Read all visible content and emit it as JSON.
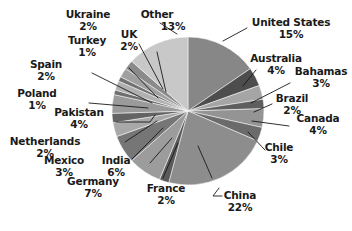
{
  "chart_data": {
    "type": "pie",
    "title": "",
    "legend_position": "outside-labels",
    "total_percent": 100,
    "start_angle_deg": 0,
    "direction": "clockwise",
    "categories": [
      "United States",
      "Australia",
      "Bahamas",
      "Brazil",
      "Canada",
      "Chile",
      "China",
      "France",
      "Germany",
      "India",
      "Mexico",
      "Netherlands",
      "Pakistan",
      "Poland",
      "Spain",
      "Turkey",
      "UK",
      "Ukraine",
      "Other"
    ],
    "values": [
      15,
      4,
      3,
      2,
      4,
      3,
      22,
      2,
      7,
      6,
      3,
      2,
      4,
      1,
      2,
      1,
      2,
      2,
      13
    ],
    "value_unit": "%",
    "slices": [
      {
        "name": "United States",
        "percent": 15,
        "label": "United States",
        "percent_label": "15%",
        "color": "#878787"
      },
      {
        "name": "Australia",
        "percent": 4,
        "label": "Australia",
        "percent_label": "4%",
        "color": "#4d4d4d"
      },
      {
        "name": "Bahamas",
        "percent": 3,
        "label": "Bahamas",
        "percent_label": "3%",
        "color": "#a5a5a5"
      },
      {
        "name": "Brazil",
        "percent": 2,
        "label": "Brazil",
        "percent_label": "2%",
        "color": "#5e5e5e"
      },
      {
        "name": "Canada",
        "percent": 4,
        "label": "Canada",
        "percent_label": "4%",
        "color": "#949494"
      },
      {
        "name": "Chile",
        "percent": 3,
        "label": "Chile",
        "percent_label": "3%",
        "color": "#6b6b6b"
      },
      {
        "name": "China",
        "percent": 22,
        "label": "China",
        "percent_label": "22%",
        "color": "#8d8d8d"
      },
      {
        "name": "France",
        "percent": 2,
        "label": "France",
        "percent_label": "2%",
        "color": "#5a5a5a"
      },
      {
        "name": "Germany",
        "percent": 7,
        "label": "Germany",
        "percent_label": "7%",
        "color": "#9c9c9c"
      },
      {
        "name": "India",
        "percent": 6,
        "label": "India",
        "percent_label": "6%",
        "color": "#767676"
      },
      {
        "name": "Mexico",
        "percent": 3,
        "label": "Mexico",
        "percent_label": "3%",
        "color": "#a8a8a8"
      },
      {
        "name": "Netherlands",
        "percent": 2,
        "label": "Netherlands",
        "percent_label": "2%",
        "color": "#636363"
      },
      {
        "name": "Pakistan",
        "percent": 4,
        "label": "Pakistan",
        "percent_label": "4%",
        "color": "#9a9a9a"
      },
      {
        "name": "Poland",
        "percent": 1,
        "label": "Poland",
        "percent_label": "1%",
        "color": "#6e6e6e"
      },
      {
        "name": "Spain",
        "percent": 2,
        "label": "Spain",
        "percent_label": "2%",
        "color": "#b0b0b0"
      },
      {
        "name": "Turkey",
        "percent": 1,
        "label": "Turkey",
        "percent_label": "1%",
        "color": "#727272"
      },
      {
        "name": "UK",
        "percent": 2,
        "label": "UK",
        "percent_label": "2%",
        "color": "#a0a0a0"
      },
      {
        "name": "Ukraine",
        "percent": 2,
        "label": "Ukraine",
        "percent_label": "2%",
        "color": "#8a8a8a"
      },
      {
        "name": "Other",
        "percent": 13,
        "label": "Other",
        "percent_label": "13%",
        "color": "#c8c8c8"
      }
    ]
  },
  "labels": {
    "united_states": {
      "name": "United States",
      "percent": "15%"
    },
    "australia": {
      "name": "Australia",
      "percent": "4%"
    },
    "bahamas": {
      "name": "Bahamas",
      "percent": "3%"
    },
    "brazil": {
      "name": "Brazil",
      "percent": "2%"
    },
    "canada": {
      "name": "Canada",
      "percent": "4%"
    },
    "chile": {
      "name": "Chile",
      "percent": "3%"
    },
    "china": {
      "name": "China",
      "percent": "22%"
    },
    "france": {
      "name": "France",
      "percent": "2%"
    },
    "germany": {
      "name": "Germany",
      "percent": "7%"
    },
    "india": {
      "name": "India",
      "percent": "6%"
    },
    "mexico": {
      "name": "Mexico",
      "percent": "3%"
    },
    "netherlands": {
      "name": "Netherlands",
      "percent": "2%"
    },
    "pakistan": {
      "name": "Pakistan",
      "percent": "4%"
    },
    "poland": {
      "name": "Poland",
      "percent": "1%"
    },
    "spain": {
      "name": "Spain",
      "percent": "2%"
    },
    "turkey": {
      "name": "Turkey",
      "percent": "1%"
    },
    "uk": {
      "name": "UK",
      "percent": "2%"
    },
    "ukraine": {
      "name": "Ukraine",
      "percent": "2%"
    },
    "other": {
      "name": "Other",
      "percent": "13%"
    }
  }
}
